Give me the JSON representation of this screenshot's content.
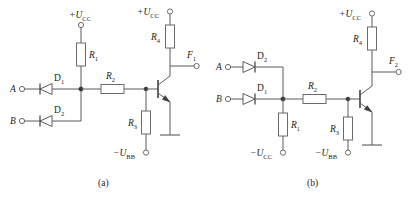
{
  "figure": {
    "type": "circuit-diagram",
    "background": "#ffffff",
    "line_color": "#5a5a5a",
    "text_color": "#231f20",
    "captions": [
      {
        "id": "caption-a",
        "text": "(a)"
      },
      {
        "id": "caption-b",
        "text": "(b)"
      }
    ]
  },
  "circuit_a": {
    "caption": "(a)",
    "inputs": [
      {
        "name": "input-a",
        "label": "A"
      },
      {
        "name": "input-b",
        "label": "B"
      }
    ],
    "output": {
      "name": "output-f1",
      "label": "F",
      "sub": "1"
    },
    "supplies": [
      {
        "name": "supply-vcc-left",
        "sign": "+",
        "label": "U",
        "sub": "CC"
      },
      {
        "name": "supply-vcc-right",
        "sign": "+",
        "label": "U",
        "sub": "CC"
      },
      {
        "name": "supply-vbb",
        "sign": "−",
        "label": "U",
        "sub": "BB"
      }
    ],
    "diodes": [
      {
        "name": "diode-d1",
        "label": "D",
        "sub": "1",
        "orientation": "left"
      },
      {
        "name": "diode-d2",
        "label": "D",
        "sub": "2",
        "orientation": "left"
      }
    ],
    "resistors": [
      {
        "name": "resistor-r1",
        "label": "R",
        "sub": "1",
        "orientation": "vertical"
      },
      {
        "name": "resistor-r2",
        "label": "R",
        "sub": "2",
        "orientation": "horizontal"
      },
      {
        "name": "resistor-r3",
        "label": "R",
        "sub": "3",
        "orientation": "vertical"
      },
      {
        "name": "resistor-r4",
        "label": "R",
        "sub": "4",
        "orientation": "vertical"
      }
    ],
    "transistor": {
      "name": "transistor-npn",
      "type": "NPN",
      "emitter": "ground"
    },
    "ground": {
      "name": "ground-symbol"
    }
  },
  "circuit_b": {
    "caption": "(b)",
    "inputs": [
      {
        "name": "input-a",
        "label": "A"
      },
      {
        "name": "input-b",
        "label": "B"
      }
    ],
    "output": {
      "name": "output-f2",
      "label": "F",
      "sub": "2"
    },
    "supplies": [
      {
        "name": "supply-vcc-top",
        "sign": "+",
        "label": "U",
        "sub": "CC"
      },
      {
        "name": "supply-vcc-bottom",
        "sign": "−",
        "label": "U",
        "sub": "CC"
      },
      {
        "name": "supply-vbb",
        "sign": "−",
        "label": "U",
        "sub": "BB"
      }
    ],
    "diodes": [
      {
        "name": "diode-d2",
        "label": "D",
        "sub": "2",
        "orientation": "right"
      },
      {
        "name": "diode-d1",
        "label": "D",
        "sub": "1",
        "orientation": "right"
      }
    ],
    "resistors": [
      {
        "name": "resistor-r1",
        "label": "R",
        "sub": "1",
        "orientation": "vertical"
      },
      {
        "name": "resistor-r2",
        "label": "R",
        "sub": "2",
        "orientation": "horizontal"
      },
      {
        "name": "resistor-r3",
        "label": "R",
        "sub": "3",
        "orientation": "vertical"
      },
      {
        "name": "resistor-r4",
        "label": "R",
        "sub": "4",
        "orientation": "vertical"
      }
    ],
    "transistor": {
      "name": "transistor-npn",
      "type": "NPN",
      "emitter": "ground"
    },
    "ground": {
      "name": "ground-symbol"
    }
  }
}
